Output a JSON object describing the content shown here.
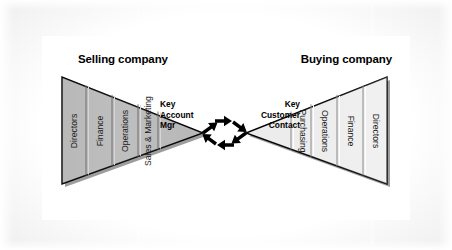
{
  "diagram": {
    "title_left": "Selling company",
    "title_right": "Buying company",
    "left_triangle": {
      "name": "selling-company-triangle",
      "fill_color": "#b4b4b4",
      "segments": [
        {
          "label": "Directors"
        },
        {
          "label": "Finance"
        },
        {
          "label": "Operations"
        },
        {
          "label": "Sales &\nMarketing"
        }
      ],
      "apex_label": "Key\nAccount\nMgr"
    },
    "right_triangle": {
      "name": "buying-company-triangle",
      "fill_color": "#ebebeb",
      "segments": [
        {
          "label": "Purchasing"
        },
        {
          "label": "Operations"
        },
        {
          "label": "Finance"
        },
        {
          "label": "Directors"
        }
      ],
      "apex_label": "Key\nCustomer\nContact"
    },
    "connector": {
      "name": "bidirectional-arrow-cycle",
      "arrow_color": "#000000",
      "arrow_count": 4,
      "description": "Four arrows forming a clockwise exchange loop between the two apexes"
    },
    "colors": {
      "panel_background": "#ffffff",
      "frame_background": "#d9d9d9",
      "outline": "#000000",
      "shadow": "#808080",
      "segment_divider": "#6e6e6e",
      "text": "#000000"
    }
  }
}
